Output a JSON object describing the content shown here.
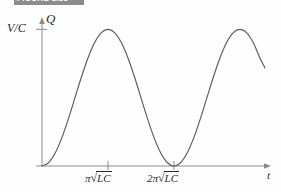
{
  "caption": {
    "text": "FIGURE 1.55",
    "bar_color": "#8c8c8c"
  },
  "axes": {
    "y_axis_name": "Q",
    "y_tick_label": "V/C",
    "x_axis_name": "t",
    "x_tick_labels": [
      "π √LC",
      "2π √LC"
    ],
    "x_tick_parts": [
      {
        "coefficient": "π",
        "sqrt": "√",
        "radicand": "LC"
      },
      {
        "coefficient": "2π",
        "sqrt": "√",
        "radicand": "LC"
      }
    ]
  },
  "colors": {
    "curve": "#5a5a5a",
    "axis": "#8a8a8a",
    "text": "#2b2b2b",
    "background": "#fefefe"
  },
  "chart_data": {
    "type": "line",
    "title": "FIGURE 1.55",
    "xlabel": "t",
    "ylabel": "Q",
    "grid": false,
    "legend": null,
    "xlim": [
      0,
      3.4
    ],
    "ylim": [
      0,
      1.12
    ],
    "x_tick_values": [
      1,
      2
    ],
    "x_tick_labels": [
      "π √LC",
      "2π √LC"
    ],
    "y_tick_values": [
      1
    ],
    "y_tick_labels": [
      "V/C"
    ],
    "formula": "Q(t) = (V/C) * (1 - cos(pi * t)) / 2, t in units of pi*sqrt(LC)",
    "annotations": [
      {
        "label": "first maximum",
        "x": 1,
        "y": 1
      },
      {
        "label": "zero / trough",
        "x": 2,
        "y": 0
      },
      {
        "label": "second maximum",
        "x": 3,
        "y": 1
      },
      {
        "label": "curve end",
        "x": 3.38,
        "y": 0.88
      }
    ],
    "series": [
      {
        "name": "Q",
        "x": [
          0.0,
          0.1,
          0.2,
          0.3,
          0.4,
          0.5,
          0.6,
          0.7,
          0.8,
          0.9,
          1.0,
          1.1,
          1.2,
          1.3,
          1.4,
          1.5,
          1.6,
          1.7,
          1.8,
          1.9,
          2.0,
          2.1,
          2.2,
          2.3,
          2.4,
          2.5,
          2.6,
          2.7,
          2.8,
          2.9,
          3.0,
          3.1,
          3.2,
          3.3,
          3.38
        ],
        "y": [
          0.0,
          0.024,
          0.095,
          0.206,
          0.345,
          0.5,
          0.655,
          0.794,
          0.905,
          0.976,
          1.0,
          0.976,
          0.905,
          0.794,
          0.655,
          0.5,
          0.345,
          0.206,
          0.095,
          0.024,
          0.0,
          0.024,
          0.095,
          0.206,
          0.345,
          0.5,
          0.655,
          0.794,
          0.905,
          0.976,
          1.0,
          0.976,
          0.905,
          0.794,
          0.717
        ]
      }
    ]
  }
}
